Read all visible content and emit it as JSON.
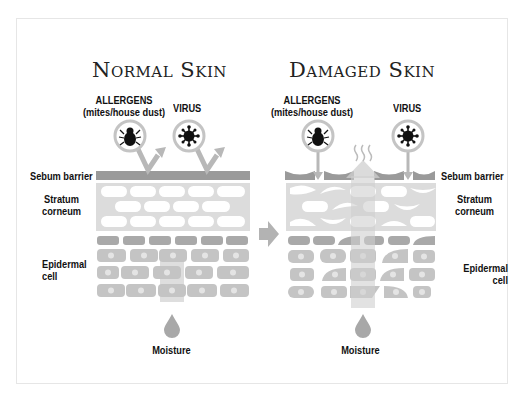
{
  "normal": {
    "title": "Normal Skin",
    "allergens_label": "ALLERGENS",
    "allergens_sub": "(mites/house dust)",
    "virus_label": "VIRUS",
    "sebum_label": "Sebum barrier",
    "stratum_label_1": "Stratum",
    "stratum_label_2": "corneum",
    "epidermal_label_1": "Epidermal",
    "epidermal_label_2": "cell",
    "moisture_label": "Moisture"
  },
  "damaged": {
    "title": "Damaged Skin",
    "allergens_label": "ALLERGENS",
    "allergens_sub": "(mites/house dust)",
    "virus_label": "VIRUS",
    "sebum_label": "Sebum barrier",
    "stratum_label_1": "Stratum",
    "stratum_label_2": "corneum",
    "epidermal_label_1": "Epidermal",
    "epidermal_label_2": "cell",
    "moisture_label": "Moisture"
  },
  "colors": {
    "barrier": "#9a9a9a",
    "stratum_bg": "#d9d9d9",
    "cell": "#bfbfbf",
    "cell_dark": "#a8a8a8",
    "arrow": "#b3b3b3",
    "ink": "#111111"
  },
  "icons": [
    "mite-icon",
    "virus-icon",
    "water-drop-icon",
    "right-arrow-icon",
    "steam-icon"
  ]
}
